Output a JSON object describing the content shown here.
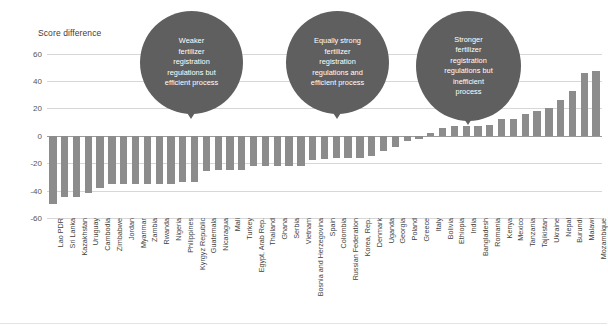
{
  "chart_data": {
    "type": "bar",
    "title": "",
    "ylabel": "Score difference",
    "xlabel": "",
    "ylim": [
      -60,
      70
    ],
    "yticks": [
      60,
      40,
      20,
      0,
      -20,
      -40,
      -60
    ],
    "grid": true,
    "legend": "none",
    "bar_color": "#8c8c8c",
    "categories": [
      "Lao PDR",
      "Sri Lanka",
      "Kazakhstan",
      "Uruguay",
      "Cambodia",
      "Zimbabwe",
      "Jordan",
      "Myanmar",
      "Zambia",
      "Rwanda",
      "Nigeria",
      "Philippines",
      "Kyrgyz Republic",
      "Guatemala",
      "Nicaragua",
      "Mali",
      "Turkey",
      "Egypt, Arab Rep.",
      "Thailand",
      "Ghana",
      "Serbia",
      "Vietnam",
      "Bosnia and Herzegovina",
      "Spain",
      "Colombia",
      "Russian Federation",
      "Korea, Rep.",
      "Denmark",
      "Uganda",
      "Georgia",
      "Poland",
      "Greece",
      "Italy",
      "Bolivia",
      "Ethiopia",
      "India",
      "Bangladesh",
      "Romania",
      "Kenya",
      "Mexico",
      "Tanzania",
      "Tajikistan",
      "Ukraine",
      "Nepal",
      "Burundi",
      "Malawi",
      "Mozambique"
    ],
    "values": [
      -50,
      -45,
      -45,
      -42,
      -38,
      -35,
      -35,
      -35,
      -35,
      -35,
      -35,
      -34,
      -34,
      -26,
      -25,
      -25,
      -25,
      -22,
      -22,
      -22,
      -22,
      -22,
      -18,
      -17,
      -16,
      -16,
      -16,
      -15,
      -11,
      -8,
      -4,
      -2,
      2,
      6,
      7,
      7,
      7,
      8,
      12,
      12,
      16,
      18,
      20,
      26,
      33,
      46,
      47
    ],
    "annotations": [
      {
        "id": "bubble-weaker",
        "lines": [
          "Weaker",
          "fertilizer",
          "registration",
          "regulations but",
          "efficient process"
        ],
        "points_to": "Philippines"
      },
      {
        "id": "bubble-equally-strong",
        "lines": [
          "Equally strong",
          "fertilizer",
          "registration",
          "regulations and",
          "efficient process"
        ],
        "points_to": "Vietnam"
      },
      {
        "id": "bubble-stronger",
        "lines": [
          "Stronger",
          "fertilizer",
          "registration",
          "regulations but",
          "inefficient",
          "process"
        ],
        "points_to": "Bangladesh"
      }
    ]
  }
}
